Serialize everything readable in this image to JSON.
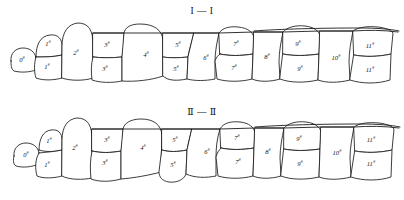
{
  "figure": {
    "title": "",
    "background_color": "#ffffff",
    "stroke_color": "#1a1a1a",
    "label_suffix": "#"
  },
  "panels": [
    {
      "id": "panel-1",
      "title": "I — I",
      "blocks": [
        {
          "id": "b0",
          "number": "0",
          "suffix": "#",
          "row": "single",
          "cx": 22,
          "cy": 60
        },
        {
          "id": "b1u",
          "number": "1",
          "suffix": "#",
          "row": "upper",
          "cx": 48,
          "cy": 44
        },
        {
          "id": "b1l",
          "number": "1",
          "suffix": "#",
          "row": "lower",
          "cx": 47,
          "cy": 67
        },
        {
          "id": "b2",
          "number": "2",
          "suffix": "#",
          "row": "single",
          "cx": 76,
          "cy": 53
        },
        {
          "id": "b3u",
          "number": "3",
          "suffix": "#",
          "row": "upper",
          "cx": 107,
          "cy": 45
        },
        {
          "id": "b3l",
          "number": "3",
          "suffix": "#",
          "row": "lower",
          "cx": 105,
          "cy": 69
        },
        {
          "id": "b4",
          "number": "4",
          "suffix": "#",
          "row": "single",
          "cx": 146,
          "cy": 55
        },
        {
          "id": "b5u",
          "number": "5",
          "suffix": "#",
          "row": "upper",
          "cx": 178,
          "cy": 45
        },
        {
          "id": "b5l",
          "number": "5",
          "suffix": "#",
          "row": "lower",
          "cx": 176,
          "cy": 69
        },
        {
          "id": "b6",
          "number": "6",
          "suffix": "#",
          "row": "single",
          "cx": 206,
          "cy": 58
        },
        {
          "id": "b7u",
          "number": "7",
          "suffix": "#",
          "row": "upper",
          "cx": 236,
          "cy": 44
        },
        {
          "id": "b7l",
          "number": "7",
          "suffix": "#",
          "row": "lower",
          "cx": 234,
          "cy": 68
        },
        {
          "id": "b8",
          "number": "8",
          "suffix": "#",
          "row": "single",
          "cx": 267,
          "cy": 57
        },
        {
          "id": "b9u",
          "number": "9",
          "suffix": "#",
          "row": "upper",
          "cx": 298,
          "cy": 44
        },
        {
          "id": "b9l",
          "number": "9",
          "suffix": "#",
          "row": "lower",
          "cx": 300,
          "cy": 69
        },
        {
          "id": "b10",
          "number": "10",
          "suffix": "#",
          "row": "single",
          "cx": 336,
          "cy": 58
        },
        {
          "id": "b11u",
          "number": "11",
          "suffix": "#",
          "row": "upper",
          "cx": 370,
          "cy": 46
        },
        {
          "id": "b11l",
          "number": "11",
          "suffix": "#",
          "row": "lower",
          "cx": 370,
          "cy": 70
        }
      ]
    },
    {
      "id": "panel-2",
      "title": "Ⅱ — Ⅱ",
      "blocks": [
        {
          "id": "c0",
          "number": "0",
          "suffix": "#",
          "row": "single",
          "cx": 26,
          "cy": 55
        },
        {
          "id": "c1u",
          "number": "1",
          "suffix": "#",
          "row": "upper",
          "cx": 49,
          "cy": 41
        },
        {
          "id": "c1l",
          "number": "1",
          "suffix": "#",
          "row": "lower",
          "cx": 47,
          "cy": 65
        },
        {
          "id": "c2",
          "number": "2",
          "suffix": "#",
          "row": "single",
          "cx": 75,
          "cy": 48
        },
        {
          "id": "c3u",
          "number": "3",
          "suffix": "#",
          "row": "upper",
          "cx": 107,
          "cy": 40
        },
        {
          "id": "c3l",
          "number": "3",
          "suffix": "#",
          "row": "lower",
          "cx": 105,
          "cy": 63
        },
        {
          "id": "c4",
          "number": "4",
          "suffix": "#",
          "row": "single",
          "cx": 143,
          "cy": 48
        },
        {
          "id": "c5u",
          "number": "5",
          "suffix": "#",
          "row": "upper",
          "cx": 175,
          "cy": 40
        },
        {
          "id": "c5l",
          "number": "5",
          "suffix": "#",
          "row": "lower",
          "cx": 173,
          "cy": 65
        },
        {
          "id": "c6",
          "number": "6",
          "suffix": "#",
          "row": "single",
          "cx": 207,
          "cy": 52
        },
        {
          "id": "c7u",
          "number": "7",
          "suffix": "#",
          "row": "upper",
          "cx": 237,
          "cy": 38
        },
        {
          "id": "c7l",
          "number": "7",
          "suffix": "#",
          "row": "lower",
          "cx": 238,
          "cy": 62
        },
        {
          "id": "c8",
          "number": "8",
          "suffix": "#",
          "row": "single",
          "cx": 268,
          "cy": 52
        },
        {
          "id": "c9u",
          "number": "9",
          "suffix": "#",
          "row": "upper",
          "cx": 299,
          "cy": 39
        },
        {
          "id": "c9l",
          "number": "9",
          "suffix": "#",
          "row": "lower",
          "cx": 300,
          "cy": 64
        },
        {
          "id": "c10",
          "number": "10",
          "suffix": "#",
          "row": "single",
          "cx": 337,
          "cy": 53
        },
        {
          "id": "c11u",
          "number": "11",
          "suffix": "#",
          "row": "upper",
          "cx": 371,
          "cy": 40
        },
        {
          "id": "c11l",
          "number": "11",
          "suffix": "#",
          "row": "lower",
          "cx": 371,
          "cy": 64
        }
      ]
    }
  ]
}
